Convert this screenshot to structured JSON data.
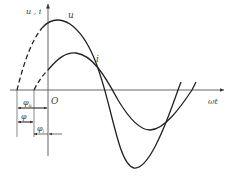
{
  "diagram": {
    "axes": {
      "y_label": "u , i",
      "x_label": "ωt",
      "origin_label": "O"
    },
    "curves": [
      {
        "name": "u",
        "label": "u",
        "style": "solid with dashed start",
        "color": "#222222"
      },
      {
        "name": "i",
        "label": "i",
        "style": "solid with dashed start",
        "color": "#222222"
      }
    ],
    "phase_annotations": [
      {
        "name": "phi-u",
        "label": "φ",
        "subscript": "u"
      },
      {
        "name": "phi",
        "label": "φ",
        "subscript": ""
      },
      {
        "name": "phi-i",
        "label": "φ",
        "subscript": "i"
      }
    ]
  }
}
